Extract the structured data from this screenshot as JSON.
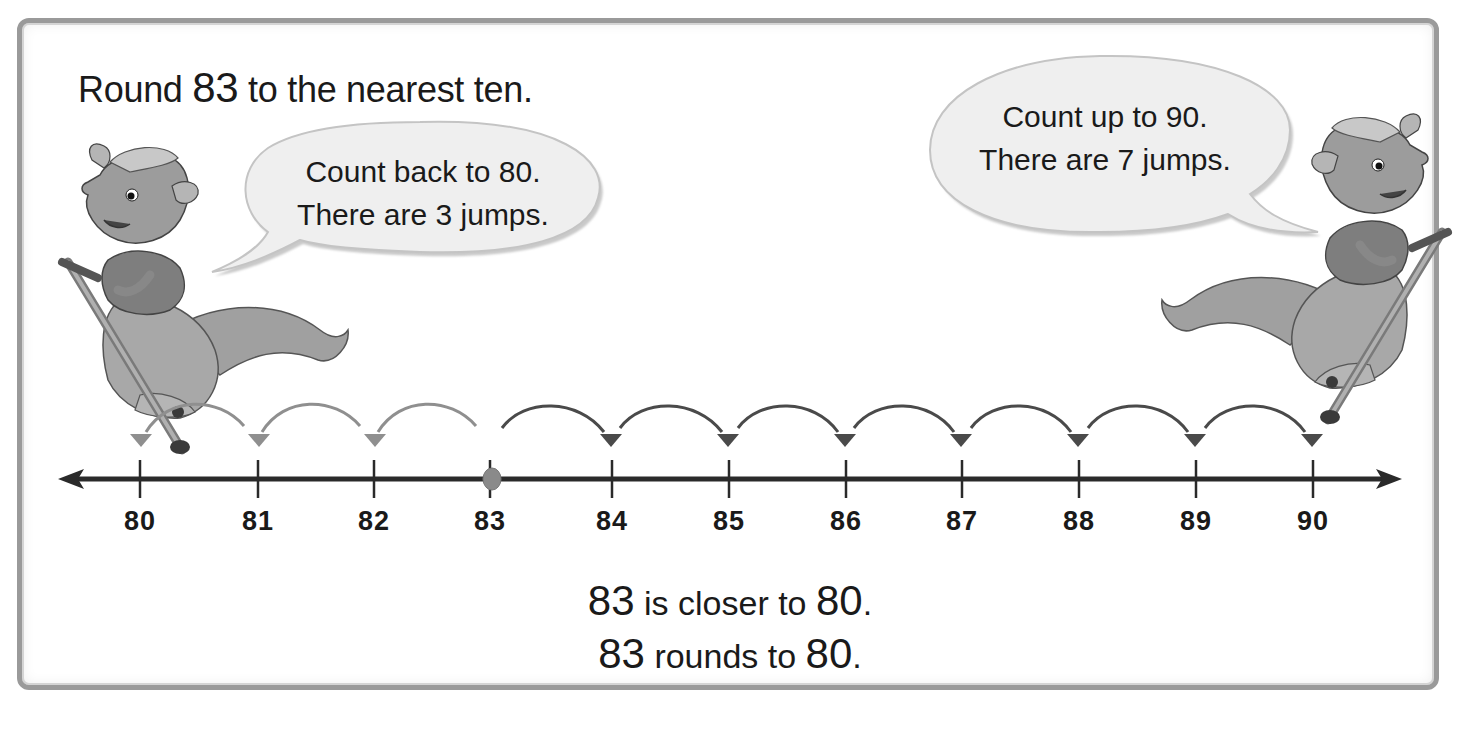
{
  "title": {
    "prefix": "Round ",
    "number": "83",
    "suffix": " to the nearest ten."
  },
  "bubbles": {
    "left": {
      "line1": "Count back to 80.",
      "line2": "There are 3 jumps."
    },
    "right": {
      "line1": "Count up to 90.",
      "line2": "There are 7 jumps."
    }
  },
  "characters": {
    "left": "kangaroo-on-pogo-stick",
    "right": "kangaroo-on-pogo-stick"
  },
  "number_line": {
    "start": 80,
    "end": 90,
    "marked_value": 83,
    "labels": [
      "80",
      "81",
      "82",
      "83",
      "84",
      "85",
      "86",
      "87",
      "88",
      "89",
      "90"
    ],
    "back_jumps": 3,
    "forward_jumps": 7,
    "colors": {
      "line": "#2a2a2a",
      "dot": "#8a8a8a",
      "back_arrows": "#8f8f8f",
      "forward_arrows": "#4a4a4a"
    }
  },
  "conclusion": {
    "line1": {
      "number": "83",
      "text": " is closer to ",
      "target": "80",
      "end": "."
    },
    "line2": {
      "number": "83",
      "text": " rounds to ",
      "target": "80",
      "end": "."
    }
  }
}
